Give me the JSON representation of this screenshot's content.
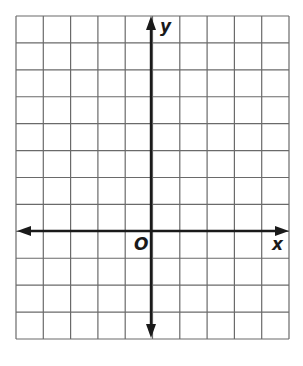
{
  "diagram": {
    "type": "coordinate-plane",
    "grid": {
      "columns": 10,
      "rows": 12,
      "left": 16,
      "top": 16,
      "right": 289,
      "bottom": 339,
      "line_color": "#6a6a6a"
    },
    "axes": {
      "color": "#1a1a1a",
      "x_axis_y": 231,
      "y_axis_x": 151,
      "x_label": "x",
      "y_label": "y",
      "origin_label": "O"
    }
  }
}
